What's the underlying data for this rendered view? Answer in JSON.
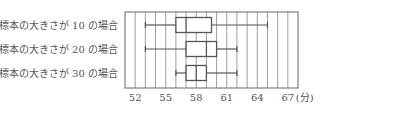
{
  "chart_data": {
    "type": "boxplot",
    "title": "",
    "xlabel": "(分)",
    "ylabel": "",
    "xlim": [
      51,
      68
    ],
    "grid": true,
    "grid_step": 1,
    "x_ticks": [
      52,
      55,
      58,
      61,
      64,
      67
    ],
    "x_tick_labels": [
      "52",
      "55",
      "58",
      "61",
      "64",
      "67"
    ],
    "unit_label": "(分)",
    "categories": [
      "標本の大きさが 10 の場合",
      "標本の大きさが 20 の場合",
      "標本の大きさが 30 の場合"
    ],
    "series": [
      {
        "name": "標本の大きさが 10 の場合",
        "min": 53,
        "q1": 56,
        "median": 57,
        "q3": 59.5,
        "max": 65
      },
      {
        "name": "標本の大きさが 20 の場合",
        "min": 53,
        "q1": 57,
        "median": 59,
        "q3": 60,
        "max": 62
      },
      {
        "name": "標本の大きさが 30 の場合",
        "min": 56,
        "q1": 57,
        "median": 58,
        "q3": 59,
        "max": 62
      }
    ],
    "colors": {
      "line": "#555555",
      "grid": "#888888"
    }
  }
}
